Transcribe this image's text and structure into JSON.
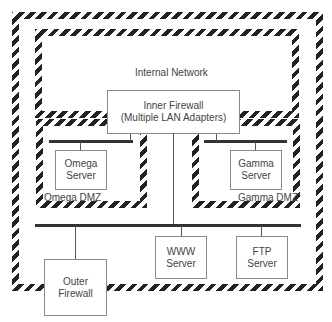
{
  "diagram": {
    "zones": {
      "perimeter": {
        "label": ""
      },
      "internal_network": {
        "label": "Internal Network"
      },
      "omega_dmz": {
        "label": "Omega DMZ"
      },
      "gamma_dmz": {
        "label": "Gamma DMZ"
      }
    },
    "nodes": {
      "inner_firewall": {
        "line1": "Inner Firewall",
        "line2": "(Multiple LAN Adapters)"
      },
      "omega_server": {
        "line1": "Omega",
        "line2": "Server"
      },
      "gamma_server": {
        "line1": "Gamma",
        "line2": "Server"
      },
      "www_server": {
        "line1": "WWW",
        "line2": "Server"
      },
      "ftp_server": {
        "line1": "FTP",
        "line2": "Server"
      },
      "outer_firewall": {
        "line1": "Outer",
        "line2": "Firewall"
      }
    },
    "colors": {
      "hatch": "#222222",
      "line": "#555555",
      "box_border": "#8a8a8a"
    }
  }
}
